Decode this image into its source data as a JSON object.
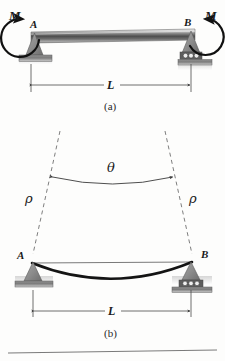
{
  "figure": {
    "title_a": "(a)",
    "title_b": "(b)",
    "panel_a": {
      "name": "simply-supported-beam-with-end-moments",
      "moment_left_label": "M",
      "moment_right_label": "M",
      "node_left_label": "A",
      "node_right_label": "B",
      "span_label": "L",
      "support_left_type": "pin-support",
      "support_right_type": "roller-support",
      "beam_style": "metallic-gradient-bar"
    },
    "panel_b": {
      "name": "deflected-beam-with-radius-of-curvature",
      "node_left_label": "A",
      "node_right_label": "B",
      "span_label": "L",
      "angle_label": "θ",
      "radius_left_label": "ρ",
      "radius_right_label": "ρ",
      "support_left_type": "pin-support",
      "support_right_type": "roller-support",
      "curve_style": "sagging-deflection-curve",
      "construction_lines": "dashed-radius-lines"
    }
  },
  "colors": {
    "background": "#fdfdfc",
    "ink": "#1a1a1a",
    "line": "#4a4a4a",
    "support_fill": "#8c8c8c",
    "hatch_fill": "#b9b9b9",
    "beam_light": "#e8e8e8",
    "beam_dark": "#4e4e4e",
    "dash": "#6f6f6f"
  }
}
